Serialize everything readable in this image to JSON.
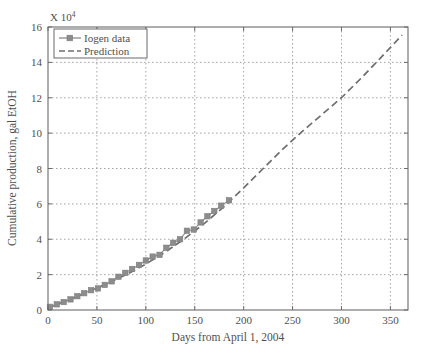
{
  "chart_data": {
    "type": "line",
    "title": "",
    "subtitle": "",
    "xlabel": "Days from April 1, 2004",
    "ylabel": "Cumulative production, gal EtOH",
    "y_exponent_prefix": "X 10",
    "y_exponent_power": "4",
    "xlim": [
      0,
      368
    ],
    "ylim": [
      0,
      16
    ],
    "xticks": [
      0,
      50,
      100,
      150,
      200,
      250,
      300,
      350
    ],
    "yticks": [
      0,
      2,
      4,
      6,
      8,
      10,
      12,
      14,
      16
    ],
    "xtick_labels": [
      "0",
      "50",
      "100",
      "150",
      "200",
      "250",
      "300",
      "350"
    ],
    "ytick_labels": [
      "0",
      "2",
      "4",
      "6",
      "8",
      "10",
      "12",
      "14",
      "16"
    ],
    "grid": true,
    "grid_style": "dotted",
    "legend_position": "upper left",
    "series": [
      {
        "name": "Iogen data",
        "style": "solid-line-with-square-markers",
        "color": "#8c8c8c",
        "marker": "square",
        "points": [
          [
            2,
            0.18
          ],
          [
            9,
            0.32
          ],
          [
            16,
            0.45
          ],
          [
            23,
            0.6
          ],
          [
            30,
            0.78
          ],
          [
            37,
            0.95
          ],
          [
            44,
            1.12
          ],
          [
            51,
            1.22
          ],
          [
            58,
            1.42
          ],
          [
            65,
            1.62
          ],
          [
            72,
            1.88
          ],
          [
            79,
            2.1
          ],
          [
            86,
            2.32
          ],
          [
            93,
            2.55
          ],
          [
            100,
            2.8
          ],
          [
            107,
            3.02
          ],
          [
            114,
            3.12
          ],
          [
            121,
            3.52
          ],
          [
            128,
            3.8
          ],
          [
            135,
            4.0
          ],
          [
            142,
            4.48
          ],
          [
            149,
            4.55
          ],
          [
            156,
            4.95
          ],
          [
            163,
            5.3
          ],
          [
            170,
            5.6
          ],
          [
            177,
            5.9
          ],
          [
            185,
            6.2
          ]
        ]
      },
      {
        "name": "Prediction",
        "style": "dashed-line",
        "color": "#6e6e6e",
        "marker": "none",
        "points": [
          [
            0,
            0.12
          ],
          [
            20,
            0.55
          ],
          [
            40,
            1.0
          ],
          [
            60,
            1.48
          ],
          [
            80,
            2.0
          ],
          [
            100,
            2.6
          ],
          [
            120,
            3.28
          ],
          [
            140,
            4.05
          ],
          [
            160,
            4.9
          ],
          [
            180,
            5.85
          ],
          [
            200,
            6.9
          ],
          [
            220,
            8.0
          ],
          [
            240,
            9.1
          ],
          [
            260,
            10.1
          ],
          [
            280,
            11.05
          ],
          [
            300,
            12.0
          ],
          [
            320,
            13.1
          ],
          [
            340,
            14.25
          ],
          [
            362,
            15.55
          ]
        ]
      }
    ],
    "legend": [
      {
        "label": "Iogen data",
        "sample": "line-with-square-marker",
        "color": "#8c8c8c"
      },
      {
        "label": "Prediction",
        "sample": "dashed-line",
        "color": "#6e6e6e"
      }
    ]
  }
}
